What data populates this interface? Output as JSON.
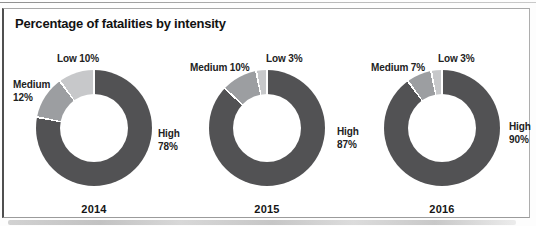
{
  "page": {
    "title": "Percentage of fatalities by intensity"
  },
  "colors": {
    "high_slice": "#525254",
    "medium_slice": "#9c9ea1",
    "low_slice": "#c7c8ca",
    "frame_border": "#9b9b9b",
    "text": "#222222"
  },
  "chart_data": [
    {
      "type": "pie",
      "subtype": "donut",
      "title": "2014",
      "categories": [
        "High",
        "Medium",
        "Low"
      ],
      "values": [
        78,
        12,
        10
      ],
      "unit": "%",
      "labels": {
        "high": "High 78%",
        "medium": "Medium 12%",
        "low": "Low 10%"
      }
    },
    {
      "type": "pie",
      "subtype": "donut",
      "title": "2015",
      "categories": [
        "High",
        "Medium",
        "Low"
      ],
      "values": [
        87,
        10,
        3
      ],
      "unit": "%",
      "labels": {
        "high": "High 87%",
        "medium": "Medium 10%",
        "low": "Low 3%"
      }
    },
    {
      "type": "pie",
      "subtype": "donut",
      "title": "2016",
      "categories": [
        "High",
        "Medium",
        "Low"
      ],
      "values": [
        90,
        7,
        3
      ],
      "unit": "%",
      "labels": {
        "high": "High 90%",
        "medium": "Medium 7%",
        "low": "Low 3%"
      }
    }
  ]
}
